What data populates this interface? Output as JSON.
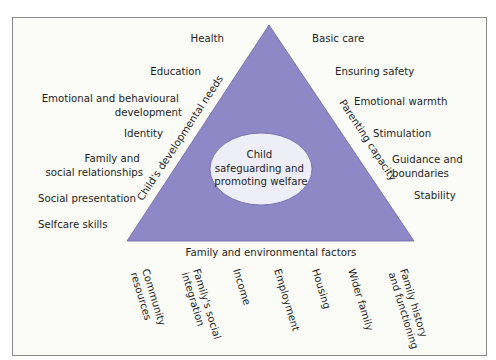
{
  "colors": {
    "background": "#ffffff",
    "frame_fill": "#fbfbf8",
    "frame_stroke": "#8a8a8a",
    "triangle_fill": "#8f88c6",
    "triangle_stroke": "#6d66a8",
    "ellipse_fill": "#eeeef8",
    "text": "#1e1e1e"
  },
  "diagram": {
    "center_label": [
      "Child",
      "safeguarding and",
      "promoting welfare"
    ],
    "sides": {
      "left": "Child's developmental needs",
      "right": "Parenting capacity",
      "bottom": "Family and environmental factors"
    },
    "left_items": [
      [
        "Health"
      ],
      [
        "Education"
      ],
      [
        "Emotional and behavioural",
        "development"
      ],
      [
        "Identity"
      ],
      [
        "Family and",
        "social relationships"
      ],
      [
        "Social presentation"
      ],
      [
        "Selfcare skills"
      ]
    ],
    "right_items": [
      [
        "Basic care"
      ],
      [
        "Ensuring safety"
      ],
      [
        "Emotional warmth"
      ],
      [
        "Stimulation"
      ],
      [
        "Guidance and",
        "boundaries"
      ],
      [
        "Stability"
      ]
    ],
    "bottom_items": [
      [
        "Community",
        "resources"
      ],
      [
        "Family's social",
        "integration"
      ],
      [
        "Income"
      ],
      [
        "Employment"
      ],
      [
        "Housing"
      ],
      [
        "Wider family"
      ],
      [
        "Family history",
        "and functioning"
      ]
    ]
  }
}
